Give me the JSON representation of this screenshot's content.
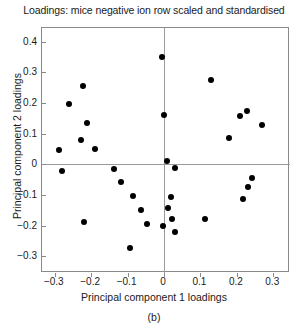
{
  "chart_data": {
    "type": "scatter",
    "title": "Loadings: mice negative ion row scaled and standardised",
    "xlabel": "Principal component 1 loadings",
    "ylabel": "Principal component 2 loadings",
    "caption": "(b)",
    "xlim": [
      -0.335,
      0.346
    ],
    "ylim": [
      -0.355,
      0.445
    ],
    "xticks": [
      -0.3,
      -0.2,
      -0.1,
      0,
      0.1,
      0.2,
      0.3
    ],
    "xticklabels": [
      "-0.3",
      "-0.2",
      "-0.1",
      "0",
      "0.1",
      "0.2",
      "0.3"
    ],
    "yticks": [
      0.4,
      0.3,
      0.2,
      0.1,
      0,
      -0.1,
      -0.2,
      -0.3
    ],
    "yticklabels": [
      "0.4",
      "0.3",
      "0.2",
      "0.1",
      "0",
      "-0.1",
      "-0.2",
      "-0.3"
    ],
    "grid": false,
    "legend": null,
    "reference_lines": [
      {
        "orientation": "horizontal",
        "value": 0,
        "color": "#9a9a9a"
      },
      {
        "orientation": "vertical",
        "value": 0,
        "color": "#9a9a9a"
      }
    ],
    "marker": {
      "shape": "circle",
      "color": "#000000",
      "size": 6
    },
    "points": [
      {
        "x": -0.005,
        "y": 0.35
      },
      {
        "x": 0.13,
        "y": 0.275
      },
      {
        "x": -0.222,
        "y": 0.256
      },
      {
        "x": -0.262,
        "y": 0.197
      },
      {
        "x": 0.228,
        "y": 0.175
      },
      {
        "x": -0.001,
        "y": 0.16
      },
      {
        "x": 0.208,
        "y": 0.158
      },
      {
        "x": 0.268,
        "y": 0.128
      },
      {
        "x": -0.211,
        "y": 0.135
      },
      {
        "x": -0.228,
        "y": 0.08
      },
      {
        "x": 0.179,
        "y": 0.085
      },
      {
        "x": -0.189,
        "y": 0.05
      },
      {
        "x": -0.287,
        "y": 0.048
      },
      {
        "x": 0.008,
        "y": 0.01
      },
      {
        "x": -0.281,
        "y": -0.022
      },
      {
        "x": 0.029,
        "y": -0.013
      },
      {
        "x": -0.137,
        "y": -0.015
      },
      {
        "x": 0.243,
        "y": -0.045
      },
      {
        "x": -0.118,
        "y": -0.058
      },
      {
        "x": 0.231,
        "y": -0.075
      },
      {
        "x": -0.085,
        "y": -0.105
      },
      {
        "x": 0.018,
        "y": -0.108
      },
      {
        "x": 0.216,
        "y": -0.112
      },
      {
        "x": 0.012,
        "y": -0.142
      },
      {
        "x": -0.063,
        "y": -0.15
      },
      {
        "x": 0.022,
        "y": -0.178
      },
      {
        "x": 0.113,
        "y": -0.18
      },
      {
        "x": -0.219,
        "y": -0.188
      },
      {
        "x": -0.047,
        "y": -0.196
      },
      {
        "x": -0.003,
        "y": -0.2
      },
      {
        "x": 0.029,
        "y": -0.222
      },
      {
        "x": -0.093,
        "y": -0.272
      }
    ]
  }
}
